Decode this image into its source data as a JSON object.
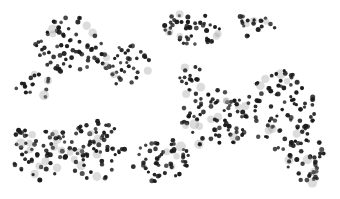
{
  "image": {
    "description": "Grayscale microscopy image of many dark round cells clustered on a white background",
    "background": "#ffffff",
    "cell_color": "#1a1a1a",
    "faint_cell_color": "#9a9a9a",
    "bounds": {
      "x": 14,
      "y": 12,
      "w": 312,
      "h": 176
    },
    "clusters": [
      {
        "cx": 70,
        "cy": 45,
        "rx": 35,
        "ry": 28,
        "n": 70
      },
      {
        "cx": 125,
        "cy": 65,
        "rx": 25,
        "ry": 22,
        "n": 40
      },
      {
        "cx": 190,
        "cy": 30,
        "rx": 30,
        "ry": 18,
        "n": 45
      },
      {
        "cx": 255,
        "cy": 25,
        "rx": 25,
        "ry": 12,
        "n": 20
      },
      {
        "cx": 40,
        "cy": 150,
        "rx": 30,
        "ry": 30,
        "n": 70
      },
      {
        "cx": 95,
        "cy": 150,
        "rx": 30,
        "ry": 30,
        "n": 70
      },
      {
        "cx": 160,
        "cy": 160,
        "rx": 30,
        "ry": 22,
        "n": 55
      },
      {
        "cx": 215,
        "cy": 120,
        "rx": 35,
        "ry": 30,
        "n": 80
      },
      {
        "cx": 280,
        "cy": 110,
        "rx": 35,
        "ry": 40,
        "n": 90
      },
      {
        "cx": 305,
        "cy": 160,
        "rx": 20,
        "ry": 25,
        "n": 40
      },
      {
        "cx": 190,
        "cy": 80,
        "rx": 15,
        "ry": 15,
        "n": 20
      },
      {
        "cx": 35,
        "cy": 85,
        "rx": 20,
        "ry": 15,
        "n": 18
      }
    ]
  }
}
